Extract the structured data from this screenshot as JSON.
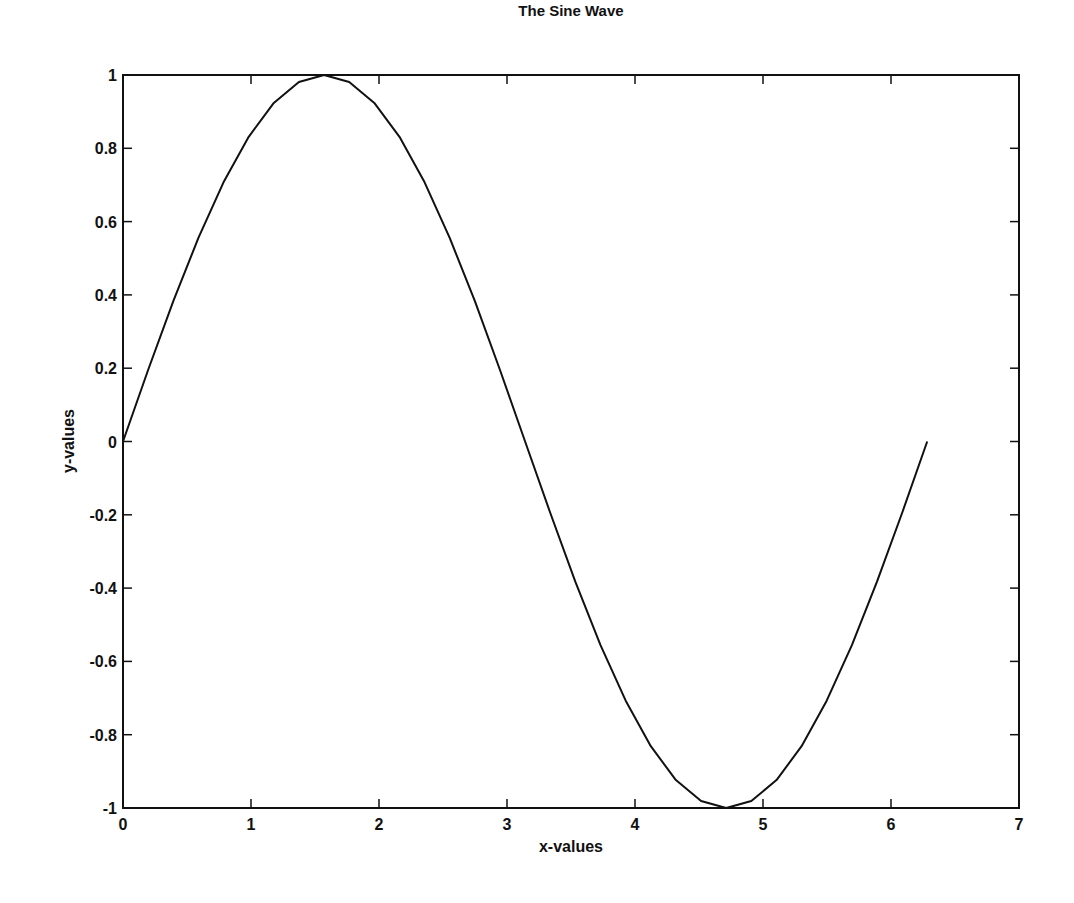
{
  "chart_data": {
    "type": "line",
    "title": "The Sine Wave",
    "xlabel": "x-values",
    "ylabel": "y-values",
    "xlim": [
      0,
      7
    ],
    "ylim": [
      -1,
      1
    ],
    "xticks": [
      "0",
      "1",
      "2",
      "3",
      "4",
      "5",
      "6",
      "7"
    ],
    "yticks": [
      "-1",
      "-0.8",
      "-0.6",
      "-0.4",
      "-0.2",
      "0",
      "0.2",
      "0.4",
      "0.6",
      "0.8",
      "1"
    ],
    "grid": false,
    "legend": null,
    "series": [
      {
        "name": "sin(x)",
        "color": "#111111",
        "x_range": [
          0,
          6.2832
        ],
        "num_points": 33,
        "function": "sin(x)"
      }
    ]
  }
}
